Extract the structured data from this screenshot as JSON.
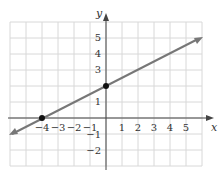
{
  "chart_data": {
    "type": "line",
    "title": "",
    "xlabel": "x",
    "ylabel": "y",
    "xlim": [
      -6,
      6
    ],
    "ylim": [
      -3,
      6
    ],
    "grid": true,
    "x_ticks": [
      "-4",
      "-3",
      "-2",
      "-1",
      "1",
      "2",
      "3",
      "4",
      "5"
    ],
    "y_ticks": [
      "5",
      "4",
      "3",
      "1",
      "-1",
      "-2"
    ],
    "series": [
      {
        "name": "line",
        "equation": "y = 0.5x + 2",
        "x": [
          -6,
          6
        ],
        "y": [
          -1,
          5
        ],
        "color": "#777777"
      }
    ],
    "points": [
      {
        "x": -4,
        "y": 0,
        "label": "x-intercept"
      },
      {
        "x": 0,
        "y": 2,
        "label": "y-intercept"
      }
    ]
  },
  "labels": {
    "x_axis": "x",
    "y_axis": "y",
    "xt": [
      "−4",
      "−3",
      "−2",
      "−1",
      "1",
      "2",
      "3",
      "4",
      "5"
    ],
    "yt": [
      "5",
      "4",
      "3",
      "1",
      "−1",
      "−2"
    ]
  }
}
